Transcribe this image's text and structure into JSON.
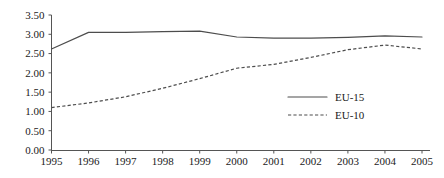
{
  "chart_data": {
    "type": "line",
    "title": "",
    "xlabel": "",
    "ylabel": "",
    "grid": false,
    "legend_position": "inside-right",
    "categories": [
      "1995",
      "1996",
      "1997",
      "1998",
      "1999",
      "2000",
      "2001",
      "2002",
      "2003",
      "2004",
      "2005"
    ],
    "x": [
      1995,
      1996,
      1997,
      1998,
      1999,
      2000,
      2001,
      2002,
      2003,
      2004,
      2005
    ],
    "xlim": [
      1995,
      2005
    ],
    "ylim": [
      0.0,
      3.5
    ],
    "ytick_labels": [
      "0.00",
      "0.50",
      "1.00",
      "1.50",
      "2.00",
      "2.50",
      "3.00",
      "3.50"
    ],
    "ytick_values": [
      0.0,
      0.5,
      1.0,
      1.5,
      2.0,
      2.5,
      3.0,
      3.5
    ],
    "series": [
      {
        "name": "EU-15",
        "style": "solid",
        "color": "#4d4d4d",
        "values": [
          2.62,
          3.05,
          3.05,
          3.07,
          3.08,
          2.93,
          2.9,
          2.9,
          2.92,
          2.96,
          2.93
        ]
      },
      {
        "name": "EU-10",
        "style": "dashed",
        "color": "#4d4d4d",
        "values": [
          1.1,
          1.22,
          1.38,
          1.6,
          1.85,
          2.12,
          2.22,
          2.4,
          2.6,
          2.72,
          2.62
        ]
      }
    ]
  },
  "legend": {
    "entries": [
      {
        "label": "EU-15",
        "style": "solid"
      },
      {
        "label": "EU-10",
        "style": "dashed"
      }
    ]
  }
}
